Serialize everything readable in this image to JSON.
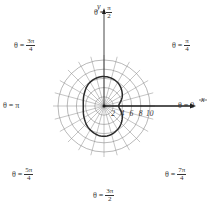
{
  "chart_data": {
    "type": "line",
    "subtype": "polar",
    "title": "",
    "center_px": [
      104,
      106
    ],
    "px_per_unit": 4.6,
    "radial_grid": [
      2,
      4,
      6,
      8,
      10
    ],
    "angular_grid_step_deg": 15,
    "x_axis_label": "x",
    "y_axis_label": "y",
    "x_tick_labels": [
      "2",
      "4",
      "6",
      "8",
      "10"
    ],
    "x_tick_values": [
      2,
      4,
      6,
      8,
      10
    ],
    "angle_labels": [
      {
        "prefix": "θ = ",
        "text": "0",
        "num": "",
        "den": "",
        "angle": "0"
      },
      {
        "prefix": "θ = ",
        "text": "",
        "num": "π",
        "den": "4",
        "angle": "π/4"
      },
      {
        "prefix": "θ = ",
        "text": "",
        "num": "π",
        "den": "2",
        "angle": "π/2"
      },
      {
        "prefix": "θ = ",
        "text": "",
        "num": "3π",
        "den": "4",
        "angle": "3π/4"
      },
      {
        "prefix": "θ = ",
        "text": "π",
        "num": "",
        "den": "",
        "angle": "π"
      },
      {
        "prefix": "θ = ",
        "text": "",
        "num": "5π",
        "den": "4",
        "angle": "5π/4"
      },
      {
        "prefix": "θ = ",
        "text": "",
        "num": "3π",
        "den": "2",
        "angle": "3π/2"
      },
      {
        "prefix": "θ = ",
        "text": "",
        "num": "7π",
        "den": "4",
        "angle": "7π/4"
      }
    ],
    "series": [
      {
        "name": "polar curve (limaçon-like closed loop)",
        "points_polar": [
          {
            "theta_deg": 0,
            "r": 3.2
          },
          {
            "theta_deg": 30,
            "r": 4.6
          },
          {
            "theta_deg": 60,
            "r": 5.9
          },
          {
            "theta_deg": 90,
            "r": 6.4
          },
          {
            "theta_deg": 120,
            "r": 6.0
          },
          {
            "theta_deg": 150,
            "r": 5.0
          },
          {
            "theta_deg": 180,
            "r": 4.5
          },
          {
            "theta_deg": 210,
            "r": 5.0
          },
          {
            "theta_deg": 240,
            "r": 6.0
          },
          {
            "theta_deg": 270,
            "r": 6.6
          },
          {
            "theta_deg": 300,
            "r": 5.9
          },
          {
            "theta_deg": 330,
            "r": 4.6
          },
          {
            "theta_deg": 360,
            "r": 3.2
          }
        ]
      }
    ],
    "grid": true,
    "legend": "none"
  },
  "colors": {
    "grid": "#8a8a8a",
    "curve": "#2a2a2a",
    "axis": "#1a1a1a",
    "text": "#333333"
  }
}
